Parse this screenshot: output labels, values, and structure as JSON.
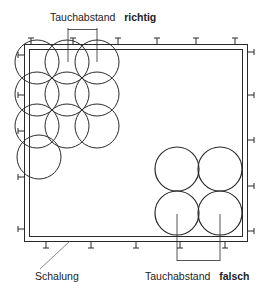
{
  "diagram": {
    "labels": {
      "top_prefix": "Tauchabstand",
      "top_emphasis": "richtig",
      "bottom_prefix": "Tauchabstand",
      "bottom_emphasis": "falsch",
      "formwork": "Schalung"
    },
    "colors": {
      "line": "#2a2a2a",
      "background": "#ffffff"
    }
  }
}
